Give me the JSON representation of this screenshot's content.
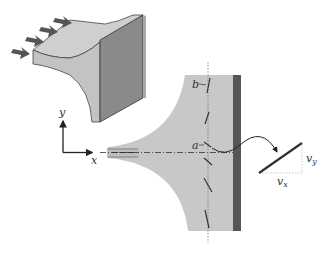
{
  "diagram": {
    "type": "fluid-flow-stagnation",
    "labels": {
      "y_axis": "y",
      "x_axis": "x",
      "point_a": "a",
      "point_b": "b",
      "vx": "v",
      "vx_sub": "x",
      "vy": "v",
      "vy_sub": "y"
    },
    "colors": {
      "fluid": "#c8c8c8",
      "wall": "#5a5a5a",
      "wall_face": "#8a8a8a",
      "line": "#333333",
      "arrow": "#555555"
    }
  }
}
